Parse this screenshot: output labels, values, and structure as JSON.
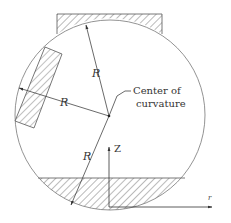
{
  "diagram": {
    "labels": {
      "center": "Center of curvature",
      "center_line1": "Center of",
      "center_line2": "curvature",
      "radius_top": "R",
      "radius_left": "R",
      "radius_bottom": "R",
      "axis_z": "Z",
      "axis_r": "r"
    },
    "colors": {
      "line": "#555555",
      "hatch": "#666666",
      "text": "#333333",
      "background": "#ffffff"
    },
    "elements": [
      "circular boundary",
      "top hatched rectangular block",
      "left tilted hatched rectangular block",
      "bottom hatched circular segment",
      "three radius arrows R from center of curvature",
      "Z-r coordinate axes"
    ]
  }
}
